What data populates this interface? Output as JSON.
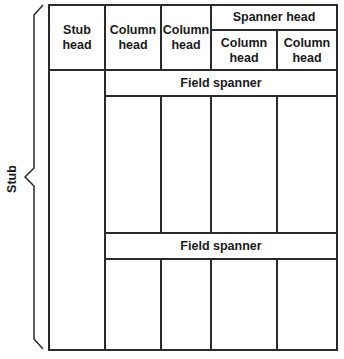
{
  "diagram": {
    "type": "table-anatomy",
    "stub_label": "Stub",
    "headers": {
      "stub_head": "Stub\nhead",
      "column_head_1": "Column\nhead",
      "column_head_2": "Column\nhead",
      "spanner_head": "Spanner head",
      "spanner_column_head_1": "Column\nhead",
      "spanner_column_head_2": "Column\nhead"
    },
    "field_spanners": [
      "Field spanner",
      "Field spanner"
    ],
    "colors": {
      "line": "#2b2b2b",
      "background": "#ffffff",
      "text": "#1a1a1a"
    }
  }
}
